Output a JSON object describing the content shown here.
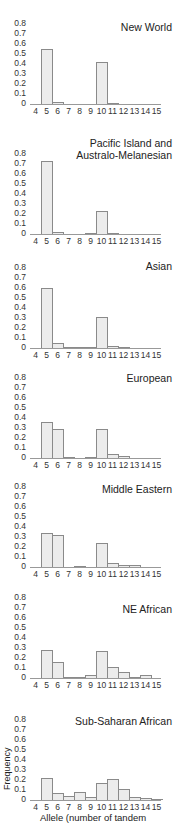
{
  "chart_data": [
    {
      "type": "bar",
      "title": "New World",
      "categories": [
        "4",
        "5",
        "6",
        "7",
        "8",
        "9",
        "10",
        "11",
        "12",
        "13",
        "14",
        "15"
      ],
      "values": [
        0,
        0.55,
        0.02,
        0,
        0,
        0,
        0.42,
        0.005,
        0,
        0,
        0,
        0
      ],
      "xlabel": "",
      "ylabel": "",
      "ylim": [
        0,
        0.8
      ],
      "yticks": [
        "0.8",
        "0.7",
        "0.6",
        "0.5",
        "0.4",
        "0.3",
        "0.2",
        "0.1",
        "0"
      ]
    },
    {
      "type": "bar",
      "title": "Pacific Island and Australo-Melanesian",
      "categories": [
        "4",
        "5",
        "6",
        "7",
        "8",
        "9",
        "10",
        "11",
        "12",
        "13",
        "14",
        "15"
      ],
      "values": [
        0,
        0.73,
        0.02,
        0,
        0,
        0.005,
        0.23,
        0.01,
        0,
        0,
        0,
        0
      ],
      "xlabel": "",
      "ylabel": "",
      "ylim": [
        0,
        0.8
      ],
      "yticks": [
        "0.8",
        "0.7",
        "0.6",
        "0.5",
        "0.4",
        "0.3",
        "0.2",
        "0.1",
        "0"
      ]
    },
    {
      "type": "bar",
      "title": "Asian",
      "categories": [
        "4",
        "5",
        "6",
        "7",
        "8",
        "9",
        "10",
        "11",
        "12",
        "13",
        "14",
        "15"
      ],
      "values": [
        0,
        0.6,
        0.05,
        0.005,
        0.005,
        0.005,
        0.31,
        0.02,
        0.005,
        0,
        0,
        0
      ],
      "xlabel": "",
      "ylabel": "",
      "ylim": [
        0,
        0.8
      ],
      "yticks": [
        "0.8",
        "0.7",
        "0.6",
        "0.5",
        "0.4",
        "0.3",
        "0.2",
        "0.1",
        "0"
      ]
    },
    {
      "type": "bar",
      "title": "European",
      "categories": [
        "4",
        "5",
        "6",
        "7",
        "8",
        "9",
        "10",
        "11",
        "12",
        "13",
        "14",
        "15"
      ],
      "values": [
        0,
        0.36,
        0.29,
        0.005,
        0,
        0.005,
        0.29,
        0.04,
        0.02,
        0,
        0,
        0
      ],
      "xlabel": "",
      "ylabel": "",
      "ylim": [
        0,
        0.8
      ],
      "yticks": [
        "0.8",
        "0.7",
        "0.6",
        "0.5",
        "0.4",
        "0.3",
        "0.2",
        "0.1",
        "0"
      ]
    },
    {
      "type": "bar",
      "title": "Middle Eastern",
      "categories": [
        "4",
        "5",
        "6",
        "7",
        "8",
        "9",
        "10",
        "11",
        "12",
        "13",
        "14",
        "15"
      ],
      "values": [
        0,
        0.34,
        0.32,
        0,
        0.005,
        0,
        0.24,
        0.04,
        0.02,
        0.02,
        0,
        0
      ],
      "xlabel": "",
      "ylabel": "",
      "ylim": [
        0,
        0.8
      ],
      "yticks": [
        "0.8",
        "0.7",
        "0.6",
        "0.5",
        "0.4",
        "0.3",
        "0.2",
        "0.1",
        "0"
      ]
    },
    {
      "type": "bar",
      "title": "NE African",
      "categories": [
        "4",
        "5",
        "6",
        "7",
        "8",
        "9",
        "10",
        "11",
        "12",
        "13",
        "14",
        "15"
      ],
      "values": [
        0,
        0.28,
        0.16,
        0.01,
        0.005,
        0.03,
        0.27,
        0.11,
        0.06,
        0.01,
        0.03,
        0
      ],
      "xlabel": "",
      "ylabel": "",
      "ylim": [
        0,
        0.8
      ],
      "yticks": [
        "0.8",
        "0.7",
        "0.6",
        "0.5",
        "0.4",
        "0.3",
        "0.2",
        "0.1",
        "0"
      ]
    },
    {
      "type": "bar",
      "title": "Sub-Saharan African",
      "categories": [
        "4",
        "5",
        "6",
        "7",
        "8",
        "9",
        "10",
        "11",
        "12",
        "13",
        "14",
        "15"
      ],
      "values": [
        0,
        0.22,
        0.07,
        0.04,
        0.08,
        0.03,
        0.17,
        0.21,
        0.11,
        0.03,
        0.02,
        0.005
      ],
      "xlabel": "Allele (number of tandem",
      "ylabel": "Frequency",
      "ylim": [
        0,
        0.8
      ],
      "yticks": [
        "0.8",
        "0.7",
        "0.6",
        "0.5",
        "0.4",
        "0.3",
        "0.2",
        "0.1",
        "0"
      ]
    }
  ],
  "panels": {
    "p0": {
      "title": "New World"
    },
    "p1": {
      "title_line1": "Pacific Island and",
      "title_line2": "Australo-Melanesian"
    },
    "p2": {
      "title": "Asian"
    },
    "p3": {
      "title": "European"
    },
    "p4": {
      "title": "Middle Eastern"
    },
    "p5": {
      "title": "NE African"
    },
    "p6": {
      "title": "Sub-Saharan African"
    }
  },
  "axes": {
    "ylabel": "Frequency",
    "xlabel": "Allele (number of tandem"
  },
  "colors": {
    "bar_fill": "#ececec",
    "bar_edge": "#8a8a8a",
    "axis": "#999999"
  }
}
